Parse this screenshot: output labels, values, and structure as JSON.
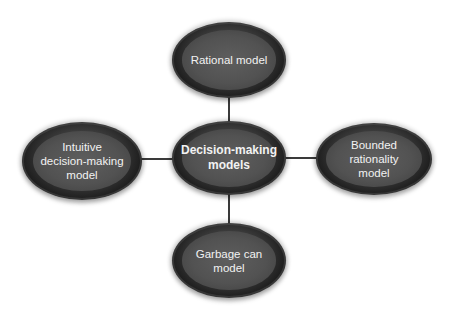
{
  "diagram": {
    "title": "Decision-making models",
    "center": {
      "label": "Decision-making\nmodels"
    },
    "nodes": [
      {
        "id": "top",
        "label": "Rational model"
      },
      {
        "id": "left",
        "label": "Intuitive\ndecision-making\nmodel"
      },
      {
        "id": "right",
        "label": "Bounded\nrationality\nmodel"
      },
      {
        "id": "bottom",
        "label": "Garbage can\nmodel"
      }
    ],
    "edges": [
      {
        "from": "center",
        "to": "top"
      },
      {
        "from": "center",
        "to": "left"
      },
      {
        "from": "center",
        "to": "right"
      },
      {
        "from": "center",
        "to": "bottom"
      }
    ],
    "colors": {
      "node_outer": "#141414",
      "node_inner": "#555555",
      "text": "#f2f2f2",
      "connector": "#3a3a3a",
      "background": "#ffffff"
    }
  }
}
